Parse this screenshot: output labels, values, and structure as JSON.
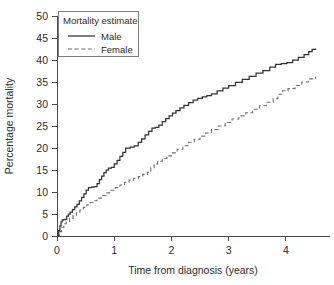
{
  "chart_data": {
    "type": "line",
    "title": "",
    "xlabel": "Time from diagnosis (years)",
    "ylabel": "Percentage mortality",
    "xlim": [
      0,
      4.6
    ],
    "ylim": [
      0,
      50
    ],
    "xticks": [
      "0",
      "1",
      "2",
      "3",
      "4"
    ],
    "xtick_values": [
      0,
      1,
      2,
      3,
      4
    ],
    "yticks": [
      "0",
      "5",
      "10",
      "15",
      "20",
      "25",
      "30",
      "35",
      "40",
      "45",
      "50"
    ],
    "ytick_values": [
      0,
      5,
      10,
      15,
      20,
      25,
      30,
      35,
      40,
      45,
      50
    ],
    "grid": false,
    "legend_position": "upper-left",
    "legend_title": "Mortality estimate",
    "legend_entries": [
      "Male",
      "Female"
    ],
    "series": [
      {
        "name": "Male",
        "style": "solid",
        "color": "#333333",
        "step": "post",
        "x": [
          0.0,
          0.03,
          0.05,
          0.07,
          0.09,
          0.11,
          0.14,
          0.17,
          0.2,
          0.23,
          0.27,
          0.31,
          0.35,
          0.39,
          0.43,
          0.47,
          0.51,
          0.55,
          0.6,
          0.65,
          0.7,
          0.74,
          0.78,
          0.82,
          0.86,
          0.9,
          0.95,
          1.0,
          1.05,
          1.1,
          1.15,
          1.2,
          1.28,
          1.35,
          1.42,
          1.48,
          1.54,
          1.6,
          1.66,
          1.72,
          1.78,
          1.84,
          1.9,
          1.96,
          2.02,
          2.08,
          2.15,
          2.22,
          2.3,
          2.38,
          2.46,
          2.54,
          2.62,
          2.7,
          2.8,
          2.9,
          3.0,
          3.12,
          3.24,
          3.36,
          3.48,
          3.6,
          3.72,
          3.82,
          3.92,
          4.02,
          4.12,
          4.22,
          4.32,
          4.4,
          4.46,
          4.52
        ],
        "y": [
          0.0,
          1.2,
          2.3,
          3.2,
          3.6,
          3.7,
          3.8,
          4.5,
          5.0,
          5.4,
          6.0,
          6.6,
          7.2,
          8.0,
          8.8,
          9.6,
          10.4,
          11.0,
          11.1,
          11.2,
          11.9,
          12.8,
          13.6,
          14.4,
          15.0,
          15.4,
          15.6,
          16.4,
          17.2,
          18.1,
          19.0,
          20.0,
          20.2,
          20.5,
          21.3,
          22.1,
          23.0,
          23.8,
          24.5,
          24.7,
          25.2,
          26.0,
          26.7,
          27.3,
          27.9,
          28.5,
          29.1,
          29.7,
          30.3,
          30.9,
          31.3,
          31.6,
          31.9,
          32.3,
          33.0,
          33.6,
          34.2,
          34.9,
          35.6,
          36.3,
          37.0,
          37.6,
          38.4,
          39.0,
          39.2,
          39.4,
          40.0,
          40.6,
          41.2,
          41.9,
          42.4,
          42.6
        ]
      },
      {
        "name": "Female",
        "style": "dashed",
        "color": "#6e6e6e",
        "step": "post",
        "x": [
          0.0,
          0.04,
          0.08,
          0.12,
          0.16,
          0.22,
          0.28,
          0.34,
          0.4,
          0.46,
          0.52,
          0.58,
          0.64,
          0.7,
          0.78,
          0.86,
          0.94,
          1.02,
          1.1,
          1.18,
          1.26,
          1.34,
          1.42,
          1.5,
          1.58,
          1.64,
          1.7,
          1.76,
          1.84,
          1.92,
          2.0,
          2.1,
          2.2,
          2.3,
          2.4,
          2.5,
          2.6,
          2.7,
          2.82,
          2.94,
          3.06,
          3.18,
          3.3,
          3.42,
          3.54,
          3.66,
          3.78,
          3.86,
          3.94,
          4.04,
          4.16,
          4.28,
          4.4,
          4.52
        ],
        "y": [
          0.0,
          1.0,
          2.0,
          2.8,
          3.3,
          4.0,
          4.7,
          5.3,
          5.9,
          6.5,
          7.1,
          7.6,
          8.0,
          8.6,
          9.2,
          9.8,
          10.4,
          11.0,
          11.6,
          12.2,
          12.7,
          13.1,
          13.5,
          14.0,
          14.5,
          15.5,
          16.4,
          17.0,
          17.6,
          18.2,
          18.9,
          19.7,
          20.5,
          21.3,
          22.0,
          22.7,
          23.4,
          24.2,
          25.0,
          25.8,
          26.6,
          27.3,
          28.0,
          28.8,
          29.6,
          30.4,
          31.2,
          32.2,
          33.0,
          33.5,
          34.2,
          35.0,
          35.7,
          36.2
        ]
      }
    ]
  },
  "axes": {
    "x_title": "Time from diagnosis (years)",
    "y_title": "Percentage mortality"
  },
  "legend": {
    "title": "Mortality estimate",
    "male_label": "Male",
    "female_label": "Female"
  },
  "colors": {
    "male": "#333333",
    "female": "#6e6e6e",
    "axis": "#4a4a4a",
    "background": "#ffffff"
  }
}
